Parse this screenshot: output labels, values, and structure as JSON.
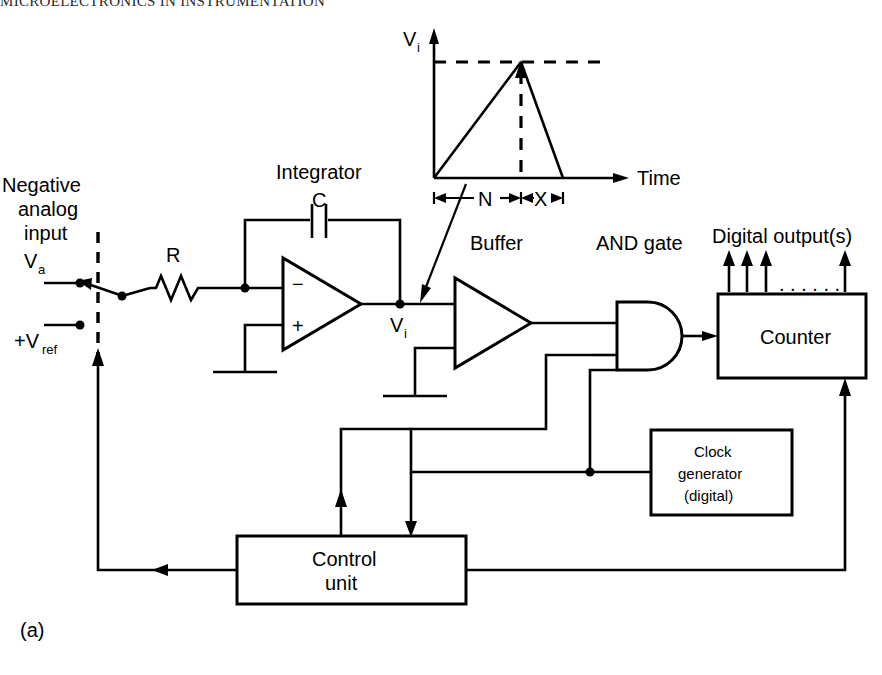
{
  "page": {
    "running_head": "MICROELECTRONICS IN INSTRUMENTATION",
    "figure_label": "(a)",
    "background": "#ffffff",
    "ink": "#000000",
    "width": 882,
    "height": 675
  },
  "waveform": {
    "y_axis_label": "V",
    "y_axis_sub": "i",
    "x_axis_label": "Time",
    "ramp_up_label": "N",
    "ramp_down_label": "X",
    "description": "dual-slope integrator ramp: rises for fixed count N then falls for unknown count X"
  },
  "input_section": {
    "title_line1": "Negative",
    "title_line2": "analog",
    "title_line3": "input",
    "signal_label": "V",
    "signal_sub": "a",
    "reference_label": "+V",
    "reference_sub": "ref",
    "switch_name": "input-selector-switch"
  },
  "components": {
    "resistor_label": "R",
    "capacitor_label": "C",
    "integrator_label": "Integrator",
    "opamp_minus": "−",
    "opamp_plus": "+",
    "integrator_output_label": "V",
    "integrator_output_sub": "i",
    "buffer_label": "Buffer",
    "and_gate_label": "AND gate"
  },
  "blocks": [
    {
      "id": "counter",
      "lines": [
        "Counter"
      ]
    },
    {
      "id": "clock-generator",
      "lines": [
        "Clock",
        "generator",
        "(digital)"
      ]
    },
    {
      "id": "control-unit",
      "lines": [
        "Control",
        "unit"
      ]
    }
  ],
  "outputs": {
    "digital_output_label": "Digital output(s)",
    "arrow_count": 3,
    "ellipsis": ". . . . . .",
    "trailing_arrow_count": 1
  }
}
